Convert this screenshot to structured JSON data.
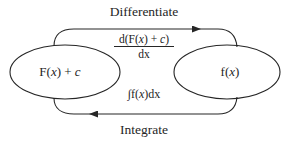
{
  "diagram": {
    "title_top": "Differentiate",
    "title_bottom": "Integrate",
    "background_color": "#ffffff",
    "stroke_color": "#262626",
    "nodes": [
      {
        "id": "left-node",
        "label": "F(x) + c",
        "shape": "ellipse",
        "cx": 65,
        "cy": 72,
        "rx": 55,
        "ry": 27
      },
      {
        "id": "right-node",
        "label": "f(x)",
        "shape": "ellipse",
        "cx": 227,
        "cy": 72,
        "rx": 53,
        "ry": 27
      }
    ],
    "edges": [
      {
        "id": "differentiate-edge",
        "from": "left-node",
        "to": "right-node",
        "direction": "right",
        "outer_label": "Differentiate",
        "inner_label_numerator": "d(F(x) + c)",
        "inner_label_denominator": "dx",
        "inner_label_type": "fraction"
      },
      {
        "id": "integrate-edge",
        "from": "right-node",
        "to": "left-node",
        "direction": "left",
        "outer_label": "Integrate",
        "inner_label": "∫f(x)dx"
      }
    ]
  }
}
